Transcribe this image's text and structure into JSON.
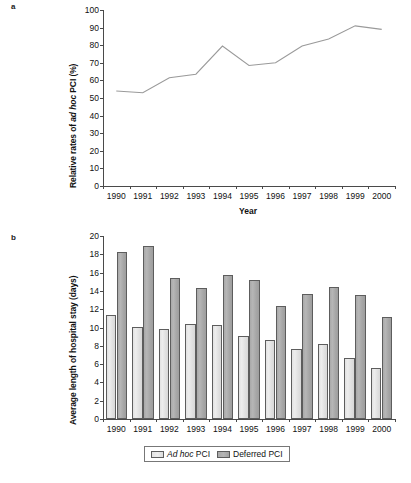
{
  "figure": {
    "panel_a_label": "a",
    "panel_b_label": "b"
  },
  "chart_data": [
    {
      "panel": "a",
      "type": "line",
      "title": "",
      "xlabel": "Year",
      "ylabel": "Relative rates of ad hoc PCI (%)",
      "ylabel_italic_part": "ad hoc",
      "categories": [
        "1990",
        "1991",
        "1992",
        "1993",
        "1994",
        "1995",
        "1996",
        "1997",
        "1998",
        "1999",
        "2000"
      ],
      "x": [
        1990,
        1991,
        1992,
        1993,
        1994,
        1995,
        1996,
        1997,
        1998,
        1999,
        2000
      ],
      "values": [
        54,
        53,
        61.5,
        63.5,
        79.5,
        68.5,
        70,
        79.5,
        83.5,
        91,
        89
      ],
      "ylim": [
        0,
        100
      ],
      "ytick_labels": [
        "0",
        "10",
        "20",
        "30",
        "40",
        "50",
        "60",
        "70",
        "80",
        "90",
        "100"
      ],
      "ytick_values": [
        0,
        10,
        20,
        30,
        40,
        50,
        60,
        70,
        80,
        90,
        100
      ],
      "grid": false,
      "legend": false,
      "line_color": "#9a9a9a"
    },
    {
      "panel": "b",
      "type": "bar",
      "title": "",
      "xlabel": "",
      "ylabel": "Average length of hospital stay (days)",
      "categories": [
        "1990",
        "1991",
        "1992",
        "1993",
        "1994",
        "1995",
        "1996",
        "1997",
        "1998",
        "1999",
        "2000"
      ],
      "series": [
        {
          "name": "Ad hoc PCI",
          "name_italic_part": "Ad hoc",
          "color": "#e6e6e6",
          "values": [
            11.4,
            10.1,
            9.8,
            10.4,
            10.3,
            9.1,
            8.6,
            7.7,
            8.2,
            6.7,
            5.6
          ]
        },
        {
          "name": "Deferred PCI",
          "color": "#adadad",
          "values": [
            18.2,
            18.9,
            15.4,
            14.3,
            15.7,
            15.2,
            12.4,
            13.7,
            14.4,
            13.6,
            11.1
          ]
        }
      ],
      "ylim": [
        0,
        20
      ],
      "ytick_labels": [
        "0",
        "2",
        "4",
        "6",
        "8",
        "10",
        "12",
        "14",
        "16",
        "18",
        "20"
      ],
      "ytick_values": [
        0,
        2,
        4,
        6,
        8,
        10,
        12,
        14,
        16,
        18,
        20
      ],
      "grid": false,
      "legend": true,
      "legend_position": "bottom"
    }
  ]
}
